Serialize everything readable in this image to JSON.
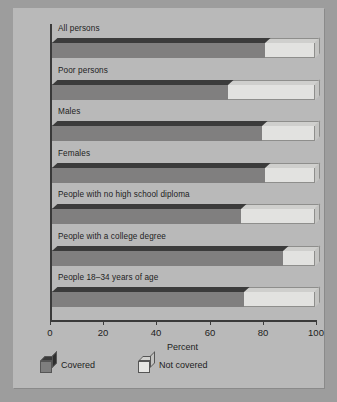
{
  "chart_data": {
    "type": "bar",
    "title": "",
    "xlabel": "Percent",
    "ylabel": "",
    "xlim": [
      0,
      100
    ],
    "xticks": [
      0,
      20,
      40,
      60,
      80,
      100
    ],
    "xtick_labels": [
      "0",
      "20",
      "40",
      "60",
      "80",
      "100"
    ],
    "grid": false,
    "orientation": "horizontal",
    "stacked": true,
    "legend_position": "bottom-left",
    "categories": [
      "All persons",
      "Poor persons",
      "Males",
      "Females",
      "People with no high school diploma",
      "People with a college degree",
      "People 18–34 years of age"
    ],
    "series": [
      {
        "name": "Covered",
        "color": "#7e7e7e",
        "values": [
          81,
          67,
          80,
          81,
          72,
          88,
          73
        ]
      },
      {
        "name": "Not covered",
        "color": "#e6e6e4",
        "values": [
          19,
          33,
          20,
          19,
          28,
          12,
          27
        ]
      }
    ],
    "legend": [
      {
        "label": "Covered",
        "color": "#7e7e7e"
      },
      {
        "label": "Not covered",
        "color": "#e6e6e4"
      }
    ]
  },
  "axis": {
    "x_title": "Percent",
    "ticks": [
      {
        "value": 0,
        "label": "0"
      },
      {
        "value": 20,
        "label": "20"
      },
      {
        "value": 40,
        "label": "40"
      },
      {
        "value": 60,
        "label": "60"
      },
      {
        "value": 80,
        "label": "80"
      },
      {
        "value": 100,
        "label": "100"
      }
    ]
  },
  "groups": [
    {
      "label": "All persons",
      "covered": 81
    },
    {
      "label": "Poor persons",
      "covered": 67
    },
    {
      "label": "Males",
      "covered": 80
    },
    {
      "label": "Females",
      "covered": 81
    },
    {
      "label": "People with no high school diploma",
      "covered": 72
    },
    {
      "label": "People with a college degree",
      "covered": 88
    },
    {
      "label": "People 18–34 years of age",
      "covered": 73
    }
  ],
  "legend": {
    "entries": [
      {
        "label": "Covered"
      },
      {
        "label": "Not covered"
      }
    ]
  },
  "colors": {
    "page": "#b9b9b9",
    "backdrop": "#9d9d9d",
    "covered_front": "#807f7f",
    "covered_top": "#3b3b3b",
    "not_covered_front": "#e2e2e0",
    "not_covered_top": "#cfcfcd",
    "axis": "#3a3a3a",
    "text": "#1d1d1d"
  }
}
